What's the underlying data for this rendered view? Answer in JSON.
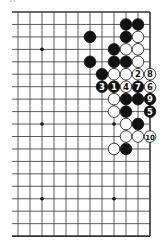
{
  "diagram": {
    "type": "go-board-fragment",
    "caption_fragment": "大",
    "grid": {
      "cols_visible": 12,
      "rows_visible": 19,
      "origin_x": 18,
      "origin_y": 12,
      "spacing_x": 12,
      "spacing_y": 12.45,
      "left_edge_x": 12,
      "right_border": true,
      "top_border": true,
      "bottom_border": true,
      "left_border": false
    },
    "hoshi": [
      [
        2,
        3
      ],
      [
        8,
        3
      ],
      [
        2,
        9
      ],
      [
        8,
        9
      ],
      [
        2,
        15
      ],
      [
        8,
        15
      ]
    ],
    "colors": {
      "black": "#111111",
      "white": "#ffffff",
      "line": "#333333"
    },
    "stones": [
      {
        "c": 9,
        "r": 1,
        "color": "black"
      },
      {
        "c": 10,
        "r": 1,
        "color": "black"
      },
      {
        "c": 6,
        "r": 2,
        "color": "black"
      },
      {
        "c": 9,
        "r": 2,
        "color": "black"
      },
      {
        "c": 10,
        "r": 2,
        "color": "white"
      },
      {
        "c": 8,
        "r": 3,
        "color": "black"
      },
      {
        "c": 9,
        "r": 3,
        "color": "white"
      },
      {
        "c": 10,
        "r": 3,
        "color": "white"
      },
      {
        "c": 6,
        "r": 4,
        "color": "black"
      },
      {
        "c": 8,
        "r": 4,
        "color": "black"
      },
      {
        "c": 9,
        "r": 4,
        "color": "black"
      },
      {
        "c": 10,
        "r": 4,
        "color": "white"
      },
      {
        "c": 7,
        "r": 5,
        "color": "black"
      },
      {
        "c": 8,
        "r": 5,
        "color": "white"
      },
      {
        "c": 9,
        "r": 5,
        "color": "white"
      },
      {
        "c": 10,
        "r": 5,
        "color": "white",
        "label": "2"
      },
      {
        "c": 11,
        "r": 5,
        "color": "white",
        "label": "8"
      },
      {
        "c": 7,
        "r": 6,
        "color": "black",
        "label": "3"
      },
      {
        "c": 8,
        "r": 6,
        "color": "black",
        "label": "1"
      },
      {
        "c": 9,
        "r": 6,
        "color": "white",
        "label": "4"
      },
      {
        "c": 10,
        "r": 6,
        "color": "black",
        "label": "7"
      },
      {
        "c": 11,
        "r": 6,
        "color": "white",
        "label": "6"
      },
      {
        "c": 8,
        "r": 7,
        "color": "white"
      },
      {
        "c": 9,
        "r": 7,
        "color": "black"
      },
      {
        "c": 10,
        "r": 7,
        "color": "black"
      },
      {
        "c": 11,
        "r": 7,
        "color": "black",
        "label": "9"
      },
      {
        "c": 8,
        "r": 8,
        "color": "white"
      },
      {
        "c": 9,
        "r": 8,
        "color": "black"
      },
      {
        "c": 11,
        "r": 8,
        "color": "black",
        "label": "5"
      },
      {
        "c": 9,
        "r": 9,
        "color": "white"
      },
      {
        "c": 10,
        "r": 9,
        "color": "black"
      },
      {
        "c": 9,
        "r": 10,
        "color": "white"
      },
      {
        "c": 10,
        "r": 10,
        "color": "white"
      },
      {
        "c": 11,
        "r": 10,
        "color": "white",
        "label": "10"
      },
      {
        "c": 8,
        "r": 11,
        "color": "white"
      },
      {
        "c": 9,
        "r": 11,
        "color": "black"
      }
    ]
  }
}
